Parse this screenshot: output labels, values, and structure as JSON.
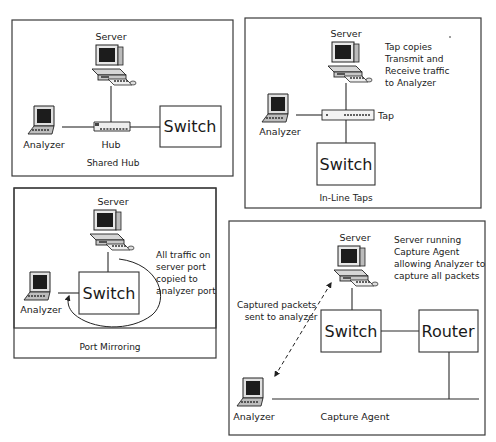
{
  "panels": {
    "shared_hub": {
      "title": "Shared Hub",
      "server_label": "Server",
      "analyzer_label": "Analyzer",
      "hub_label": "Hub",
      "switch_label": "Switch"
    },
    "inline_taps": {
      "title": "In-Line Taps",
      "server_label": "Server",
      "analyzer_label": "Analyzer",
      "tap_label": "Tap",
      "switch_label": "Switch",
      "note_lines": [
        "Tap copies",
        "Transmit and",
        "Receive traffic",
        "to Analyzer"
      ]
    },
    "port_mirroring": {
      "title": "Port Mirroring",
      "server_label": "Server",
      "analyzer_label": "Analyzer",
      "switch_label": "Switch",
      "note_lines": [
        "All traffic on",
        "server port",
        "copied to",
        "analyzer port"
      ]
    },
    "capture_agent": {
      "title": "Capture Agent",
      "server_label": "Server",
      "analyzer_label": "Analyzer",
      "switch_label": "Switch",
      "router_label": "Router",
      "note_lines": [
        "Server running",
        "Capture Agent",
        "allowing Analyzer to",
        "capture all packets"
      ],
      "packets_lines": [
        "Captured packets",
        "sent to analyzer"
      ]
    }
  }
}
